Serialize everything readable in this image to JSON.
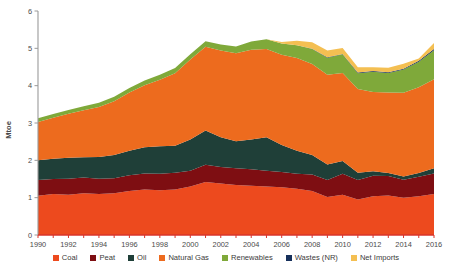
{
  "chart_data": {
    "type": "area",
    "stacked": true,
    "title": "",
    "subtitle": "",
    "xlabel": "",
    "ylabel": "Mtoe",
    "xlim": [
      1990,
      2016
    ],
    "ylim": [
      0,
      6
    ],
    "y_ticks": [
      0,
      1,
      2,
      3,
      4,
      5,
      6
    ],
    "x_ticks": [
      1990,
      1992,
      1994,
      1996,
      1998,
      2000,
      2002,
      2004,
      2006,
      2008,
      2010,
      2012,
      2014,
      2016
    ],
    "x_tick_labels": [
      "1990",
      "1992",
      "1994",
      "1996",
      "1998",
      "2000",
      "2002",
      "2004",
      "2006",
      "2008",
      "2010",
      "2012",
      "2014",
      "2016"
    ],
    "y_tick_labels": [
      "0",
      "1",
      "2",
      "3",
      "4",
      "5",
      "6"
    ],
    "grid": false,
    "legend_position": "bottom",
    "x": [
      1990,
      1991,
      1992,
      1993,
      1994,
      1995,
      1996,
      1997,
      1998,
      1999,
      2000,
      2001,
      2002,
      2003,
      2004,
      2005,
      2006,
      2007,
      2008,
      2009,
      2010,
      2011,
      2012,
      2013,
      2014,
      2015,
      2016
    ],
    "series": [
      {
        "name": "Coal",
        "color": "#ED4A1E",
        "values": [
          1.05,
          1.1,
          1.08,
          1.12,
          1.1,
          1.12,
          1.18,
          1.22,
          1.2,
          1.22,
          1.3,
          1.42,
          1.38,
          1.34,
          1.32,
          1.3,
          1.28,
          1.24,
          1.18,
          1.02,
          1.08,
          0.95,
          1.04,
          1.06,
          1.0,
          1.04,
          1.1
        ]
      },
      {
        "name": "Peat",
        "color": "#7E0E12",
        "values": [
          0.42,
          0.4,
          0.43,
          0.42,
          0.41,
          0.4,
          0.42,
          0.43,
          0.44,
          0.45,
          0.42,
          0.46,
          0.44,
          0.45,
          0.44,
          0.42,
          0.41,
          0.4,
          0.44,
          0.45,
          0.56,
          0.52,
          0.55,
          0.52,
          0.48,
          0.52,
          0.55
        ]
      },
      {
        "name": "Oil",
        "color": "#1F3F38",
        "values": [
          0.53,
          0.54,
          0.56,
          0.54,
          0.58,
          0.62,
          0.66,
          0.7,
          0.74,
          0.72,
          0.84,
          0.92,
          0.8,
          0.72,
          0.8,
          0.9,
          0.72,
          0.62,
          0.52,
          0.42,
          0.34,
          0.2,
          0.12,
          0.08,
          0.09,
          0.1,
          0.14
        ]
      },
      {
        "name": "Natural Gas",
        "color": "#ED6B1E",
        "values": [
          1.03,
          1.1,
          1.18,
          1.26,
          1.34,
          1.44,
          1.56,
          1.66,
          1.78,
          1.94,
          2.14,
          2.24,
          2.32,
          2.36,
          2.4,
          2.36,
          2.42,
          2.48,
          2.44,
          2.4,
          2.36,
          2.24,
          2.12,
          2.16,
          2.24,
          2.3,
          2.38
        ]
      },
      {
        "name": "Renewables",
        "color": "#7FA93A",
        "values": [
          0.1,
          0.1,
          0.1,
          0.11,
          0.11,
          0.12,
          0.12,
          0.13,
          0.13,
          0.14,
          0.14,
          0.15,
          0.16,
          0.18,
          0.22,
          0.26,
          0.3,
          0.34,
          0.4,
          0.46,
          0.5,
          0.42,
          0.54,
          0.52,
          0.62,
          0.68,
          0.78
        ]
      },
      {
        "name": "Wastes (NR)",
        "color": "#16305B",
        "values": [
          0.0,
          0.0,
          0.0,
          0.0,
          0.0,
          0.0,
          0.0,
          0.0,
          0.0,
          0.0,
          0.0,
          0.0,
          0.0,
          0.0,
          0.0,
          0.0,
          0.0,
          0.0,
          0.01,
          0.01,
          0.01,
          0.02,
          0.02,
          0.02,
          0.02,
          0.03,
          0.03
        ]
      },
      {
        "name": "Net Imports",
        "color": "#F4BF52",
        "values": [
          0.0,
          0.0,
          0.0,
          0.0,
          0.0,
          0.0,
          0.0,
          0.0,
          0.0,
          0.0,
          0.0,
          0.0,
          0.0,
          0.0,
          0.0,
          0.0,
          0.04,
          0.12,
          0.17,
          0.18,
          0.16,
          0.14,
          0.1,
          0.12,
          0.14,
          0.06,
          0.16
        ]
      }
    ]
  },
  "legend": {
    "items": [
      {
        "label": "Coal",
        "color": "#ED4A1E"
      },
      {
        "label": "Peat",
        "color": "#7E0E12"
      },
      {
        "label": "Oil",
        "color": "#1F3F38"
      },
      {
        "label": "Natural Gas",
        "color": "#ED6B1E"
      },
      {
        "label": "Renewables",
        "color": "#7FA93A"
      },
      {
        "label": "Wastes (NR)",
        "color": "#16305B"
      },
      {
        "label": "Net Imports",
        "color": "#F4BF52"
      }
    ]
  },
  "colors": {
    "axis": "#9a9a9a",
    "x_axis": "#d9352a",
    "text": "#3b3b3b",
    "background": "#ffffff"
  }
}
